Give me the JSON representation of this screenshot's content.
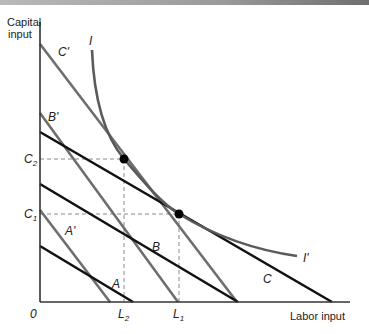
{
  "figure": {
    "y_axis_label_line1": "Capital",
    "y_axis_label_line2": "input",
    "x_axis_label": "Labor input",
    "origin_label": "0",
    "y_ticks": [
      {
        "main": "C",
        "sub": "2"
      },
      {
        "main": "C",
        "sub": "1"
      }
    ],
    "x_ticks": [
      {
        "main": "L",
        "sub": "2"
      },
      {
        "main": "L",
        "sub": "1"
      }
    ],
    "isoquant_labels": {
      "start": "I",
      "end": "I'"
    },
    "isocost_labels": {
      "A": "A",
      "B": "B",
      "C": "C",
      "A_prime": "A'",
      "B_prime": "B'",
      "C_prime": "C'"
    },
    "colors": {
      "black_lines": "#111111",
      "gray_lines": "#6e6e6e",
      "isoquant": "#5a5a5a",
      "dashed": "#8a8a8a",
      "points": "#000000"
    }
  }
}
